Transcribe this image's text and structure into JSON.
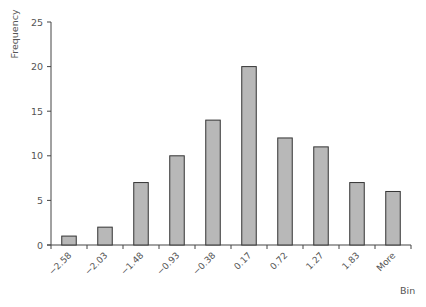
{
  "chart_data": {
    "type": "bar",
    "title": "",
    "xlabel": "Bin",
    "ylabel": "Frequency",
    "categories": [
      "-2.58",
      "-2.03",
      "-1.48",
      "-0.93",
      "-0.38",
      "0.17",
      "0.72",
      "1.27",
      "1.83",
      "More"
    ],
    "values": [
      1,
      2,
      7,
      10,
      14,
      20,
      12,
      11,
      7,
      6
    ],
    "ylim": [
      0,
      25
    ],
    "yticks": [
      0,
      5,
      10,
      15,
      20,
      25
    ],
    "grid": false,
    "legend": null,
    "colors": {
      "bar_fill": "#b8b8b8",
      "bar_stroke": "#333333",
      "axis": "#444444",
      "text": "#555555"
    }
  },
  "labels": {
    "x_axis": "Bin",
    "y_axis": "Frequency"
  }
}
